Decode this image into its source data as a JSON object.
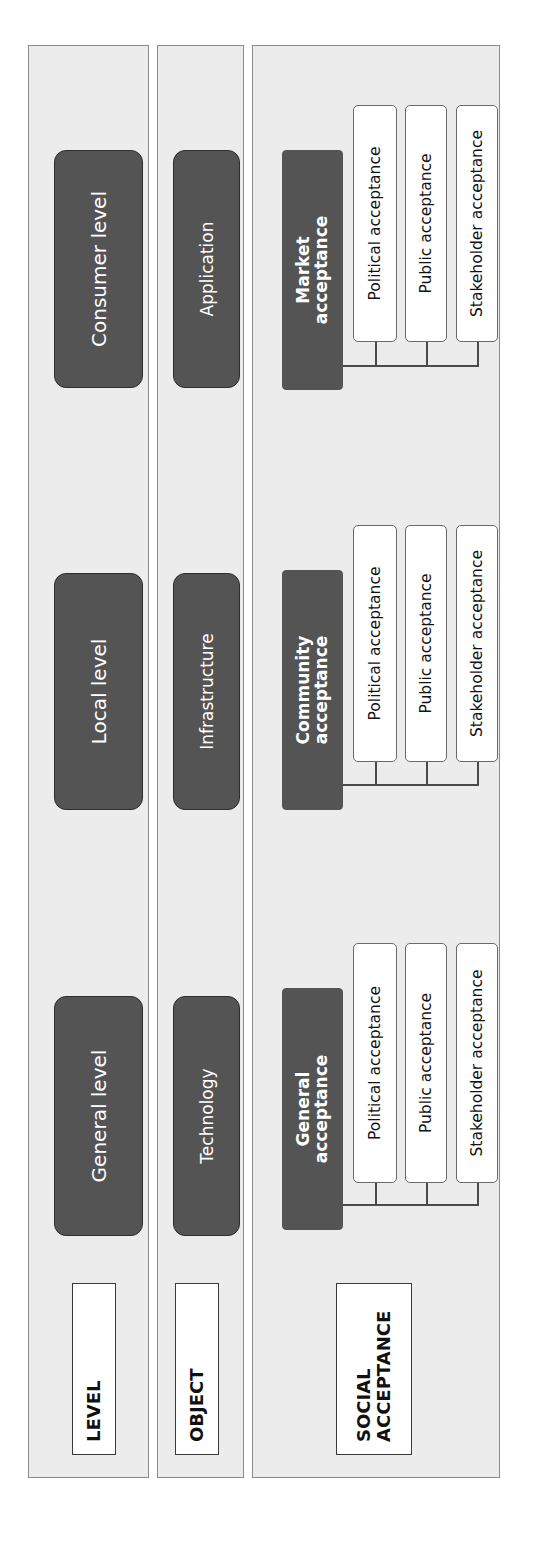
{
  "rows": {
    "level": {
      "label": "LEVEL",
      "items": [
        "General level",
        "Local level",
        "Consumer level"
      ]
    },
    "object": {
      "label": "OBJECT",
      "items": [
        "Technology",
        "Infrastructure",
        "Application"
      ]
    },
    "social_acceptance": {
      "label_line1": "SOCIAL",
      "label_line2": "ACCEPTANCE",
      "groups": [
        {
          "title_line1": "General",
          "title_line2": "acceptance",
          "children": [
            "Political acceptance",
            "Public acceptance",
            "Stakeholder acceptance"
          ]
        },
        {
          "title_line1": "Community",
          "title_line2": "acceptance",
          "children": [
            "Political acceptance",
            "Public acceptance",
            "Stakeholder acceptance"
          ]
        },
        {
          "title_line1": "Market",
          "title_line2": "acceptance",
          "children": [
            "Political acceptance",
            "Public acceptance",
            "Stakeholder acceptance"
          ]
        }
      ]
    }
  },
  "colors": {
    "panel_bg": "#ececec",
    "dark_box": "#545454",
    "border": "#8a8a8a"
  }
}
